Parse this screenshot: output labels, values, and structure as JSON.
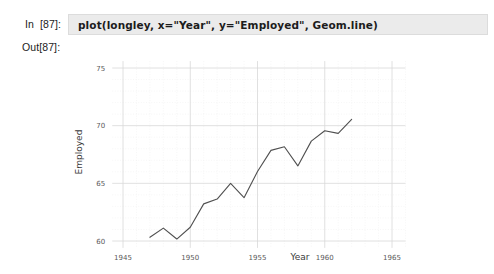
{
  "notebook": {
    "in_label": "In",
    "in_number": "[87]:",
    "out_label": "Out[87]:",
    "code": "plot(longley, x=\"Year\", y=\"Employed\", Geom.line)"
  },
  "chart_data": {
    "type": "line",
    "title": "",
    "subtitle": "",
    "xlabel": "Year",
    "ylabel": "Employed",
    "xlim": [
      1944.2,
      1966.0
    ],
    "ylim": [
      59.4,
      75.6
    ],
    "xticks": [
      1945,
      1950,
      1955,
      1960,
      1965
    ],
    "xtick_labels": [
      "1945",
      "1950",
      "1955",
      "1960",
      "1965"
    ],
    "yticks": [
      60,
      65,
      70,
      75
    ],
    "ytick_labels": [
      "60",
      "65",
      "70",
      "75"
    ],
    "grid": true,
    "minor_grid": true,
    "legend": false,
    "legend_position": "none",
    "line_color": "#4f4f4f",
    "grid_color": "#d8d8d8",
    "x": [
      1947,
      1948,
      1949,
      1950,
      1951,
      1952,
      1953,
      1954,
      1955,
      1956,
      1957,
      1958,
      1959,
      1960,
      1961,
      1962
    ],
    "series": [
      {
        "name": "Employed",
        "values": [
          60.32,
          61.12,
          60.17,
          61.19,
          63.22,
          63.64,
          64.99,
          63.76,
          66.02,
          67.86,
          68.17,
          66.51,
          68.66,
          69.56,
          69.33,
          70.55
        ]
      }
    ]
  }
}
